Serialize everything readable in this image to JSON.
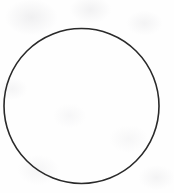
{
  "canvas": {
    "width": 174,
    "height": 193,
    "background_color": "#fefefe",
    "description": "Scanned line drawing of a single empty circle outline"
  },
  "figure": {
    "shape_name": "circle-outline",
    "stroke_color": "#2a2a2a",
    "fill_color": "none",
    "stroke_width": 1.6,
    "center_x": 81.5,
    "center_y": 106,
    "radius": 77.5,
    "diameter": 155,
    "bounds": {
      "left": 4,
      "top": 29,
      "right": 159,
      "bottom": 183
    }
  },
  "labels": {
    "text_present": "none"
  }
}
